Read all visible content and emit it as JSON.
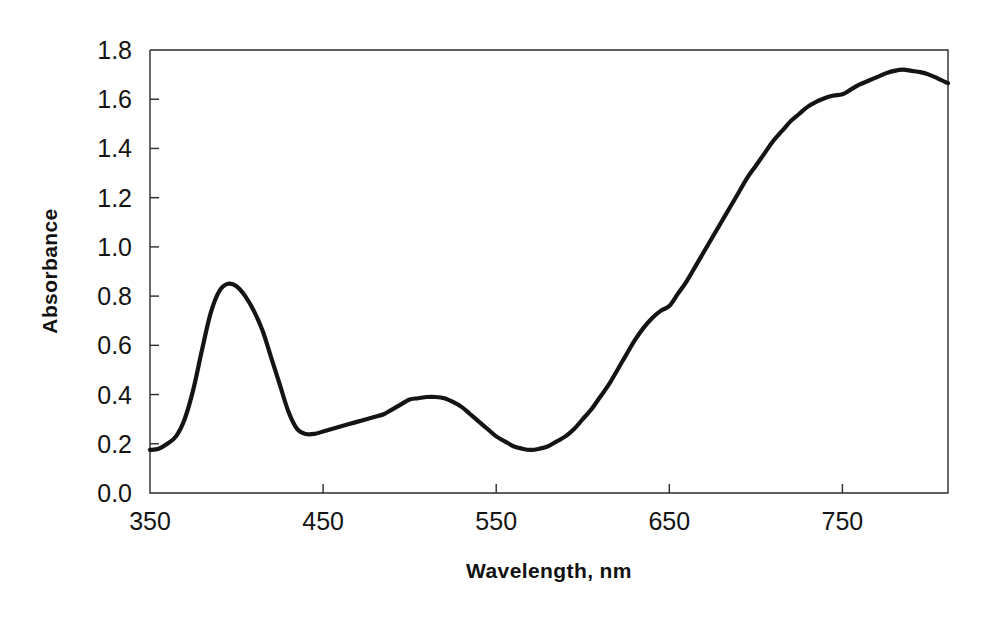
{
  "figure": {
    "background_color": "#ffffff",
    "curve_color": "#141414",
    "axis_color": "#2b2b2b"
  },
  "axes": {
    "x_title": "Wavelength, nm",
    "y_title": "Absorbance",
    "x_ticks": [
      "350",
      "450",
      "550",
      "650",
      "750"
    ],
    "y_ticks": [
      "0.0",
      "0.2",
      "0.4",
      "0.6",
      "0.8",
      "1.0",
      "1.2",
      "1.4",
      "1.6",
      "1.8"
    ]
  },
  "chart_data": {
    "type": "line",
    "title": "",
    "subtitle": "",
    "xlabel": "Wavelength, nm",
    "ylabel": "Absorbance",
    "xlim": [
      350,
      811
    ],
    "ylim": [
      0.0,
      1.8
    ],
    "xticks": [
      350,
      450,
      550,
      650,
      750
    ],
    "yticks": [
      0.0,
      0.2,
      0.4,
      0.6,
      0.8,
      1.0,
      1.2,
      1.4,
      1.6,
      1.8
    ],
    "grid": false,
    "legend": null,
    "annotations": [],
    "series": [
      {
        "name": "Absorbance spectrum",
        "color": "#141414",
        "x": [
          350,
          355,
          360,
          365,
          370,
          375,
          380,
          385,
          390,
          395,
          400,
          405,
          410,
          415,
          420,
          425,
          430,
          435,
          440,
          445,
          450,
          455,
          460,
          465,
          470,
          475,
          480,
          485,
          490,
          495,
          500,
          505,
          510,
          515,
          520,
          525,
          530,
          535,
          540,
          545,
          550,
          555,
          560,
          565,
          570,
          575,
          580,
          585,
          590,
          595,
          600,
          605,
          610,
          615,
          620,
          625,
          630,
          635,
          640,
          645,
          650,
          655,
          660,
          665,
          670,
          675,
          680,
          685,
          690,
          695,
          700,
          705,
          710,
          715,
          720,
          725,
          730,
          735,
          740,
          745,
          750,
          755,
          760,
          765,
          770,
          775,
          780,
          785,
          790,
          795,
          800,
          805,
          811
        ],
        "y": [
          0.175,
          0.18,
          0.2,
          0.23,
          0.3,
          0.42,
          0.58,
          0.73,
          0.82,
          0.85,
          0.84,
          0.8,
          0.74,
          0.66,
          0.55,
          0.44,
          0.33,
          0.26,
          0.24,
          0.24,
          0.25,
          0.26,
          0.27,
          0.28,
          0.29,
          0.3,
          0.31,
          0.32,
          0.34,
          0.36,
          0.38,
          0.385,
          0.39,
          0.39,
          0.385,
          0.37,
          0.35,
          0.32,
          0.29,
          0.26,
          0.23,
          0.21,
          0.19,
          0.18,
          0.175,
          0.18,
          0.19,
          0.21,
          0.23,
          0.26,
          0.3,
          0.34,
          0.39,
          0.44,
          0.5,
          0.56,
          0.62,
          0.67,
          0.71,
          0.74,
          0.76,
          0.81,
          0.86,
          0.92,
          0.98,
          1.04,
          1.1,
          1.16,
          1.22,
          1.28,
          1.33,
          1.38,
          1.43,
          1.47,
          1.51,
          1.54,
          1.57,
          1.59,
          1.605,
          1.615,
          1.62,
          1.64,
          1.66,
          1.675,
          1.69,
          1.705,
          1.715,
          1.72,
          1.715,
          1.71,
          1.7,
          1.685,
          1.665
        ]
      }
    ],
    "features": {
      "peak_1": {
        "x": 395,
        "y": 0.85
      },
      "valley_1": {
        "x": 437,
        "y": 0.24
      },
      "peak_2": {
        "x": 510,
        "y": 0.39
      },
      "valley_2": {
        "x": 570,
        "y": 0.175
      },
      "peak_3": {
        "x": 785,
        "y": 1.72
      },
      "endpoint_left": {
        "x": 350,
        "y": 0.175
      },
      "endpoint_right": {
        "x": 811,
        "y": 1.665
      }
    }
  }
}
